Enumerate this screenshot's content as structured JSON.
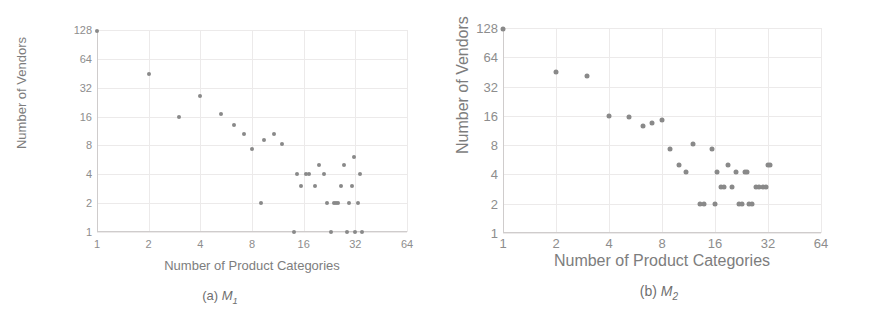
{
  "figure": {
    "panels": [
      {
        "id": "a",
        "caption_prefix": "(a) ",
        "caption_symbol": "M",
        "caption_sub": "1",
        "chart_data": {
          "type": "scatter",
          "title": "",
          "xlabel": "Number of Product Categories",
          "ylabel": "Number of Vendors",
          "xscale": "log2",
          "yscale": "log2",
          "xlim": [
            1,
            64
          ],
          "ylim": [
            1,
            128
          ],
          "xticks": [
            "1",
            "2",
            "4",
            "8",
            "16",
            "32",
            "64"
          ],
          "xtick_values": [
            1,
            2,
            4,
            8,
            16,
            32,
            64
          ],
          "yticks": [
            "1",
            "2",
            "4",
            "8",
            "16",
            "32",
            "64",
            "128"
          ],
          "ytick_values": [
            1,
            2,
            4,
            8,
            16,
            32,
            64,
            128
          ],
          "grid": true,
          "legend": "none",
          "marker_color": "#898989",
          "points": [
            [
              1,
              124
            ],
            [
              2,
              45
            ],
            [
              3,
              16
            ],
            [
              4,
              26
            ],
            [
              5.3,
              17
            ],
            [
              6.3,
              13
            ],
            [
              7.2,
              10.5
            ],
            [
              8,
              7.3
            ],
            [
              9,
              2
            ],
            [
              9.4,
              9.2
            ],
            [
              10.8,
              10.6
            ],
            [
              12,
              8.2
            ],
            [
              14,
              1
            ],
            [
              14.6,
              4
            ],
            [
              15.4,
              3
            ],
            [
              16.5,
              4
            ],
            [
              17.3,
              4
            ],
            [
              18.6,
              3
            ],
            [
              19.6,
              5
            ],
            [
              21,
              4
            ],
            [
              22,
              2
            ],
            [
              23,
              1
            ],
            [
              24,
              2
            ],
            [
              24.7,
              2
            ],
            [
              25.5,
              2
            ],
            [
              26.5,
              3
            ],
            [
              27.5,
              5
            ],
            [
              28.5,
              1
            ],
            [
              29.5,
              2
            ],
            [
              30.5,
              3
            ],
            [
              31.5,
              6
            ],
            [
              32,
              1
            ],
            [
              33,
              2
            ],
            [
              34,
              4
            ],
            [
              35,
              1
            ]
          ]
        }
      },
      {
        "id": "b",
        "caption_prefix": "(b) ",
        "caption_symbol": "M",
        "caption_sub": "2",
        "chart_data": {
          "type": "scatter",
          "title": "",
          "xlabel": "Number of Product Categories",
          "ylabel": "Number of Vendors",
          "xscale": "log2",
          "yscale": "log2",
          "xlim": [
            1,
            64
          ],
          "ylim": [
            1,
            128
          ],
          "xticks": [
            "1",
            "2",
            "4",
            "8",
            "16",
            "32",
            "64"
          ],
          "xtick_values": [
            1,
            2,
            4,
            8,
            16,
            32,
            64
          ],
          "yticks": [
            "1",
            "2",
            "4",
            "8",
            "16",
            "32",
            "64",
            "128"
          ],
          "ytick_values": [
            1,
            2,
            4,
            8,
            16,
            32,
            64,
            128
          ],
          "grid": true,
          "legend": "none",
          "marker_color": "#898989",
          "points": [
            [
              1,
              124
            ],
            [
              2,
              45
            ],
            [
              3,
              41
            ],
            [
              4,
              16
            ],
            [
              5.2,
              15.5
            ],
            [
              6.2,
              12.5
            ],
            [
              7,
              13.5
            ],
            [
              8,
              14.5
            ],
            [
              8.9,
              7.3
            ],
            [
              10,
              5
            ],
            [
              10.9,
              4.2
            ],
            [
              12,
              8.3
            ],
            [
              13.2,
              2
            ],
            [
              13.9,
              2
            ],
            [
              15.4,
              7.3
            ],
            [
              16,
              2
            ],
            [
              16.4,
              4.2
            ],
            [
              17.4,
              3
            ],
            [
              18,
              3
            ],
            [
              19,
              5
            ],
            [
              19.9,
              3
            ],
            [
              21,
              4.2
            ],
            [
              22,
              2
            ],
            [
              22.8,
              2
            ],
            [
              23.7,
              4.2
            ],
            [
              24.3,
              4.2
            ],
            [
              25,
              2
            ],
            [
              26,
              2
            ],
            [
              27.5,
              3
            ],
            [
              28.5,
              3
            ],
            [
              30,
              3
            ],
            [
              31,
              3
            ],
            [
              32,
              5
            ],
            [
              32.8,
              5
            ]
          ]
        }
      }
    ]
  }
}
